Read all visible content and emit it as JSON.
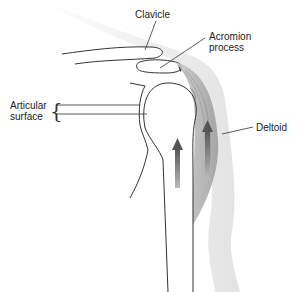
{
  "diagram": {
    "labels": {
      "clavicle": "Clavicle",
      "acromion_line1": "Acromion",
      "acromion_line2": "process",
      "articular_line1": "Articular",
      "articular_line2": "surface",
      "deltoid": "Deltoid"
    },
    "brace_glyph": "{",
    "arrows": [
      {
        "name": "humerus-arrow",
        "direction": "up"
      },
      {
        "name": "deltoid-arrow",
        "direction": "up"
      }
    ],
    "colors": {
      "outline": "#333333",
      "muscle": "#b8b8b8",
      "skin_shadow": "#d9d9d9",
      "arrow": "#555555"
    }
  }
}
